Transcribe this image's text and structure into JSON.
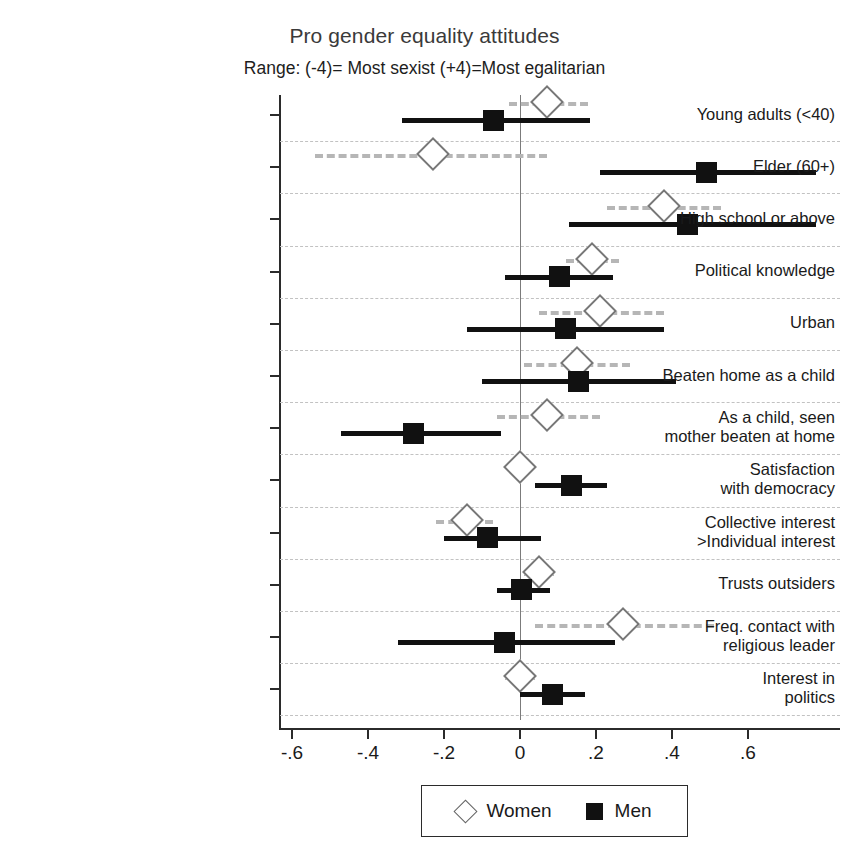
{
  "chart_data": {
    "type": "scatter",
    "title": "Pro gender equality attitudes",
    "subtitle": "Range: (-4)= Most sexist (+4)=Most egalitarian",
    "xlabel": "",
    "ylabel": "",
    "xlim": [
      -0.68,
      0.82
    ],
    "grid": true,
    "legend_position": "bottom",
    "xticks": [
      "-.6",
      "-.4",
      "-.2",
      "0",
      ".2",
      ".4",
      ".6"
    ],
    "xtick_values": [
      -0.6,
      -0.4,
      -0.2,
      0,
      0.2,
      0.4,
      0.6
    ],
    "zero_reference": 0,
    "categories": [
      "Young adults (<40)",
      "Elder (60+)",
      "High school or above",
      "Political knowledge",
      "Urban",
      "Beaten home as a child",
      "As a child, seen\nmother beaten at home",
      "Satisfaction\nwith democracy",
      "Collective interest\n>Individual interest",
      "Trusts outsiders",
      "Freq. contact with\nreligious leader",
      "Interest in\npolitics"
    ],
    "series": [
      {
        "name": "Women",
        "marker": "open-diamond",
        "color": "#ffffff",
        "edge_color": "#777777",
        "ci_style": "dashed",
        "ci_color": "#b6b6b6",
        "values": [
          0.07,
          -0.23,
          0.38,
          0.19,
          0.21,
          0.15,
          0.07,
          0.0,
          -0.14,
          0.05,
          0.27,
          0.0
        ],
        "ci_low": [
          -0.03,
          -0.54,
          0.23,
          0.12,
          0.05,
          0.01,
          -0.06,
          -0.03,
          -0.22,
          0.01,
          0.04,
          -0.04
        ],
        "ci_high": [
          0.18,
          0.07,
          0.53,
          0.26,
          0.38,
          0.29,
          0.21,
          0.03,
          -0.07,
          0.09,
          0.51,
          0.04
        ]
      },
      {
        "name": "Men",
        "marker": "filled-square",
        "color": "#111111",
        "edge_color": "#111111",
        "ci_style": "solid",
        "ci_color": "#111111",
        "values": [
          -0.07,
          0.49,
          0.44,
          0.105,
          0.12,
          0.155,
          -0.28,
          0.135,
          -0.085,
          0.005,
          -0.04,
          0.085
        ],
        "ci_low": [
          -0.31,
          0.21,
          0.13,
          -0.04,
          -0.14,
          -0.1,
          -0.47,
          0.04,
          -0.2,
          -0.06,
          -0.32,
          0.0
        ],
        "ci_high": [
          0.185,
          0.78,
          0.78,
          0.245,
          0.38,
          0.41,
          -0.05,
          0.23,
          0.055,
          0.08,
          0.25,
          0.17
        ]
      }
    ]
  },
  "legend": {
    "items": [
      {
        "label": "Women",
        "marker": "open-diamond"
      },
      {
        "label": "Men",
        "marker": "filled-square"
      }
    ]
  }
}
